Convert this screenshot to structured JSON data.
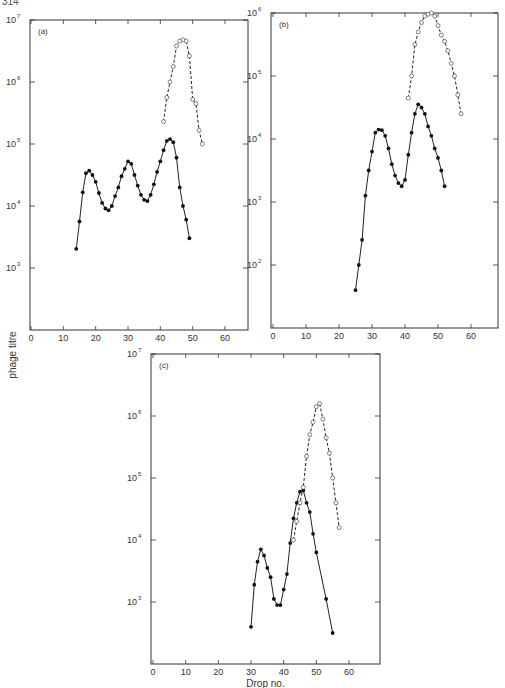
{
  "page_number": "314",
  "chart_data": [
    {
      "type": "line",
      "panel_label": "(a)",
      "xlabel": "",
      "ylabel": "phage titre",
      "yscale": "log",
      "xlim": [
        0,
        70
      ],
      "ylim_log10": [
        2,
        7
      ],
      "x_ticks": [
        0,
        10,
        20,
        30,
        40,
        50,
        60
      ],
      "y_ticks_log10": [
        3,
        4,
        5,
        6,
        7
      ],
      "y_tick_labels": [
        "10",
        "10",
        "10",
        "10",
        "10"
      ],
      "y_tick_exponents": [
        "3",
        "4",
        "5",
        "6",
        "7"
      ],
      "series": [
        {
          "name": "filled circles (solid line)",
          "marker": "filled",
          "x": [
            14,
            15,
            16,
            17,
            18,
            19,
            20,
            21,
            22,
            23,
            24,
            25,
            26,
            27,
            28,
            29,
            30,
            31,
            32,
            33,
            34,
            35,
            36,
            37,
            38,
            39,
            40,
            41,
            42,
            43,
            44,
            45,
            46,
            47,
            48,
            49
          ],
          "log10_y": [
            3.31,
            3.75,
            4.22,
            4.53,
            4.57,
            4.5,
            4.39,
            4.21,
            4.05,
            3.96,
            3.93,
            4.0,
            4.16,
            4.3,
            4.48,
            4.6,
            4.72,
            4.68,
            4.5,
            4.33,
            4.18,
            4.1,
            4.08,
            4.18,
            4.35,
            4.55,
            4.72,
            4.9,
            5.05,
            5.08,
            5.03,
            4.78,
            4.3,
            4.0,
            3.78,
            3.48
          ]
        },
        {
          "name": "open circles (dashed line)",
          "marker": "open",
          "x": [
            41,
            42,
            43,
            44,
            45,
            46,
            47,
            48,
            49,
            50,
            51,
            52,
            53
          ],
          "log10_y": [
            5.36,
            5.75,
            6.0,
            6.25,
            6.58,
            6.66,
            6.68,
            6.66,
            6.42,
            5.72,
            5.65,
            5.22,
            5.0
          ]
        }
      ]
    },
    {
      "type": "line",
      "panel_label": "(b)",
      "xlabel": "",
      "ylabel": "",
      "yscale": "log",
      "xlim": [
        0,
        70
      ],
      "ylim_log10": [
        1,
        6
      ],
      "x_ticks": [
        0,
        10,
        20,
        30,
        40,
        50,
        60
      ],
      "y_ticks_log10": [
        2,
        3,
        4,
        5,
        6
      ],
      "y_tick_labels": [
        "10",
        "10",
        "10",
        "10",
        "10"
      ],
      "y_tick_exponents": [
        "2",
        "3",
        "4",
        "5",
        "6"
      ],
      "series": [
        {
          "name": "filled circles (solid line)",
          "marker": "filled",
          "x": [
            25,
            26,
            27,
            28,
            29,
            30,
            31,
            32,
            33,
            34,
            35,
            36,
            37,
            38,
            39,
            40,
            41,
            42,
            43,
            44,
            45,
            46,
            47,
            48,
            49,
            50,
            51,
            52
          ],
          "log10_y": [
            1.6,
            2.0,
            2.4,
            3.1,
            3.5,
            3.8,
            4.1,
            4.15,
            4.14,
            4.05,
            3.85,
            3.6,
            3.42,
            3.3,
            3.25,
            3.35,
            3.75,
            4.1,
            4.4,
            4.55,
            4.5,
            4.4,
            4.2,
            4.05,
            3.85,
            3.7,
            3.5,
            3.25
          ]
        },
        {
          "name": "open circles (dashed line)",
          "marker": "open",
          "x": [
            41,
            42,
            43,
            44,
            45,
            46,
            47,
            48,
            49,
            50,
            51,
            52,
            53,
            54,
            55,
            56,
            57
          ],
          "log10_y": [
            4.65,
            5.0,
            5.5,
            5.7,
            5.85,
            5.95,
            5.98,
            6.0,
            5.95,
            5.8,
            5.65,
            5.55,
            5.4,
            5.2,
            5.0,
            4.7,
            4.4
          ]
        }
      ]
    },
    {
      "type": "line",
      "panel_label": "(c)",
      "xlabel": "Drop no.",
      "ylabel": "",
      "yscale": "log",
      "xlim": [
        0,
        70
      ],
      "ylim_log10": [
        2,
        7
      ],
      "x_ticks": [
        0,
        10,
        20,
        30,
        40,
        50,
        60
      ],
      "y_ticks_log10": [
        3,
        4,
        5,
        6,
        7
      ],
      "y_tick_labels": [
        "10",
        "10",
        "10",
        "10",
        "10"
      ],
      "y_tick_exponents": [
        "3",
        "4",
        "5",
        "6",
        "7"
      ],
      "series": [
        {
          "name": "filled circles (solid line)",
          "marker": "filled",
          "x": [
            30,
            31,
            32,
            33,
            34,
            35,
            36,
            37,
            38,
            39,
            40,
            41,
            42,
            43,
            44,
            45,
            46,
            47,
            48,
            49,
            50,
            53,
            55
          ],
          "log10_y": [
            2.6,
            3.28,
            3.65,
            3.85,
            3.75,
            3.55,
            3.4,
            3.05,
            2.95,
            2.95,
            3.2,
            3.45,
            3.95,
            4.35,
            4.6,
            4.78,
            4.8,
            4.6,
            4.45,
            4.1,
            3.8,
            3.05,
            2.5
          ]
        },
        {
          "name": "open circles (dashed line)",
          "marker": "open",
          "x": [
            43,
            44,
            45,
            46,
            47,
            48,
            49,
            50,
            51,
            52,
            53,
            54,
            55,
            56,
            57
          ],
          "log10_y": [
            4.0,
            4.3,
            4.6,
            4.85,
            5.35,
            5.7,
            5.9,
            6.15,
            6.2,
            5.95,
            5.65,
            5.4,
            5.0,
            4.6,
            4.2
          ]
        }
      ]
    }
  ]
}
